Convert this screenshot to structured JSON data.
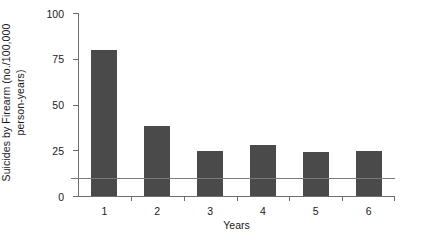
{
  "chart_data": {
    "type": "bar",
    "title": "",
    "categories": [
      "1",
      "2",
      "3",
      "4",
      "5",
      "6"
    ],
    "values": [
      80,
      38,
      24.5,
      28,
      24,
      24.5
    ],
    "series": [
      {
        "name": "Suicides by Firearm",
        "values": [
          80,
          38,
          24.5,
          28,
          24,
          24.5
        ]
      }
    ],
    "xlabel": "Years",
    "ylabel": "Suicides by Firearm (no./100,000 person-years)",
    "ylabel_line1": "Suicides by Firearm (no./100,000",
    "ylabel_line2": "person-years)",
    "ylim": [
      0,
      100
    ],
    "yticks": [
      0,
      25,
      50,
      75,
      100
    ],
    "ytick_labels": [
      "0",
      "25",
      "50",
      "75",
      "100"
    ],
    "xtick_labels": [
      "1",
      "2",
      "3",
      "4",
      "5",
      "6"
    ],
    "grid": false,
    "legend": null,
    "annotations": [
      {
        "type": "horizontal-reference-line",
        "value": 10,
        "label": ""
      }
    ],
    "colors": {
      "bar": "#4a4a4a",
      "axis": "#6d6d6d",
      "reference_line": "#7a7a7a",
      "background": "#ffffff",
      "text": "#1a1a1a"
    }
  }
}
